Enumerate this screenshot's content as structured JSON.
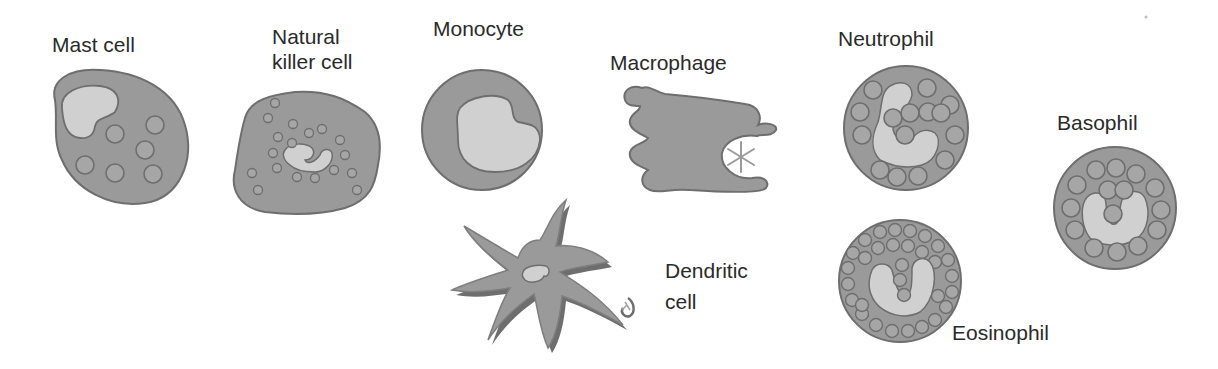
{
  "colors": {
    "background": "#ffffff",
    "cytoplasm": "#9a9a9a",
    "outline": "#6e6e6e",
    "nucleus": "#d0d0d0",
    "granule": "#a6a6a6",
    "text": "#2a2a2a"
  },
  "cells": [
    {
      "id": "mast-cell",
      "label_lines": [
        "Mast cell"
      ]
    },
    {
      "id": "natural-killer-cell",
      "label_lines": [
        "Natural",
        "killer cell"
      ]
    },
    {
      "id": "monocyte",
      "label_lines": [
        "Monocyte"
      ]
    },
    {
      "id": "macrophage",
      "label_lines": [
        "Macrophage"
      ]
    },
    {
      "id": "dendritic-cell",
      "label_lines": [
        "Dendritic",
        "cell"
      ]
    },
    {
      "id": "neutrophil",
      "label_lines": [
        "Neutrophil"
      ]
    },
    {
      "id": "basophil",
      "label_lines": [
        "Basophil"
      ]
    },
    {
      "id": "eosinophil",
      "label_lines": [
        "Eosinophil"
      ]
    }
  ]
}
